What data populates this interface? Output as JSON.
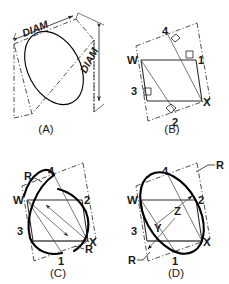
{
  "figure": {
    "background_color": "#ffffff",
    "line_color": "#2b2b2b",
    "heavy_line_color": "#000000"
  },
  "panels": [
    {
      "id": "A",
      "caption": "(A)",
      "description": "Isometric circle shown as ellipse inscribed in an isometric square, with DIAM dimensions on two sides",
      "labels": {
        "diam_top": "DIAM",
        "diam_right": "DIAM"
      }
    },
    {
      "id": "B",
      "caption": "(B)",
      "description": "Isometric square W-X with perpendicular bisector construction lines to points 1, 2, 3, 4 and right-angle marks",
      "labels": {
        "w": "W",
        "x": "X",
        "p1": "1",
        "p2": "2",
        "p3": "3",
        "p4": "4"
      }
    },
    {
      "id": "C",
      "caption": "(C)",
      "description": "Large radius arcs struck from centers, labelled R, forming two of the four-center approximate ellipse arcs",
      "labels": {
        "w": "W",
        "x": "X",
        "p1": "1",
        "p2": "2",
        "p3": "3",
        "p4": "4",
        "r_upper": "R",
        "r_lower": "R"
      }
    },
    {
      "id": "D",
      "caption": "(D)",
      "description": "Completed four-center approximate ellipse with small radius arcs R struck from centers Y and Z",
      "labels": {
        "w": "W",
        "x": "X",
        "p1": "1",
        "p2": "2",
        "p3": "3",
        "p4": "4",
        "y": "Y",
        "z": "Z",
        "r_upper": "R",
        "r_lower": "R"
      }
    }
  ]
}
